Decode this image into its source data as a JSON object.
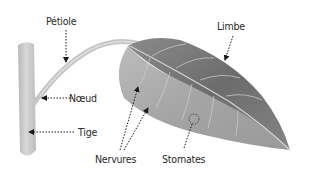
{
  "diagram": {
    "labels": {
      "petiole": "Pétiole",
      "limbe": "Limbe",
      "noeud": "Nœud",
      "tige": "Tige",
      "nervures": "Nervures",
      "stomates": "Stomates"
    },
    "colors": {
      "stem": "#c8c8c8",
      "leaf_dark": "#6f6f6f",
      "leaf_light": "#b4b4b4",
      "text": "#2a2a2a",
      "arrow": "#1a1a1a"
    }
  }
}
